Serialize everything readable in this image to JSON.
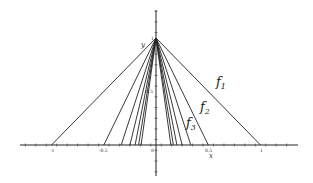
{
  "chart_data": {
    "type": "line",
    "title": "",
    "xlabel": "x",
    "ylabel": "y",
    "xlim": [
      -1.2,
      1.2
    ],
    "ylim": [
      -0.3,
      1.2
    ],
    "grid": false,
    "x_tick_labels": [
      "-1",
      "-0.5",
      "0",
      "0.5",
      "1"
    ],
    "y_tick_labels": [
      "1",
      "0.5"
    ],
    "series": [
      {
        "name": "f1",
        "label": "f",
        "sub": "1",
        "points": [
          [
            -1,
            0
          ],
          [
            0,
            1
          ],
          [
            1,
            0
          ]
        ]
      },
      {
        "name": "f2",
        "label": "f",
        "sub": "2",
        "points": [
          [
            -0.5,
            0
          ],
          [
            0,
            1
          ],
          [
            0.5,
            0
          ]
        ]
      },
      {
        "name": "f3",
        "label": "f",
        "sub": "3",
        "points": [
          [
            -0.3333,
            0
          ],
          [
            0,
            1
          ],
          [
            0.3333,
            0
          ]
        ]
      },
      {
        "name": "f4",
        "points": [
          [
            -0.25,
            0
          ],
          [
            0,
            1
          ],
          [
            0.25,
            0
          ]
        ]
      },
      {
        "name": "f5",
        "points": [
          [
            -0.2,
            0
          ],
          [
            0,
            1
          ],
          [
            0.2,
            0
          ]
        ]
      },
      {
        "name": "f6",
        "points": [
          [
            -0.1667,
            0
          ],
          [
            0,
            1
          ],
          [
            0.1667,
            0
          ]
        ]
      },
      {
        "name": "f7",
        "points": [
          [
            -0.1429,
            0
          ],
          [
            0,
            1
          ],
          [
            0.1429,
            0
          ]
        ]
      }
    ],
    "annotations": [
      {
        "text": "f1",
        "x": 0.62,
        "y": 0.6
      },
      {
        "text": "f2",
        "x": 0.45,
        "y": 0.38
      },
      {
        "text": "f3",
        "x": 0.31,
        "y": 0.23
      }
    ]
  }
}
